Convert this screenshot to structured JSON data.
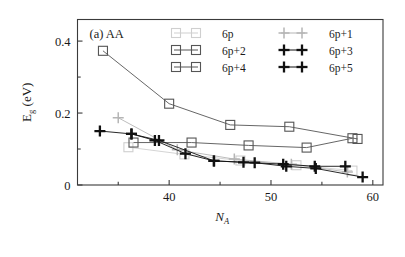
{
  "figure": {
    "panel_label": "(a) AA"
  },
  "axes": {
    "xlabel_main": "N",
    "xlabel_sub": "A",
    "ylabel_main": "E",
    "ylabel_sub": "g",
    "ylabel_unit": " (eV)",
    "x_ticklabels": [
      "40",
      "50",
      "60"
    ],
    "y_ticklabels": [
      "0",
      "0.2",
      "0.4"
    ]
  },
  "legend": {
    "entries": [
      {
        "label": "6p",
        "marker": "square",
        "color": "#cfcfcf"
      },
      {
        "label": "6p+1",
        "marker": "plus",
        "color": "#b5b5b5"
      },
      {
        "label": "6p+2",
        "marker": "square",
        "color": "#555555"
      },
      {
        "label": "6p+3",
        "marker": "plus",
        "color": "#111111"
      },
      {
        "label": "6p+4",
        "marker": "square",
        "color": "#555555"
      },
      {
        "label": "6p+5",
        "marker": "plus",
        "color": "#111111"
      }
    ]
  },
  "chart_data": {
    "type": "line",
    "title": "(a) AA",
    "xlabel": "N_A",
    "ylabel": "E_g (eV)",
    "xlim": [
      31,
      61
    ],
    "ylim": [
      0.0,
      0.46
    ],
    "xticks": [
      40,
      50,
      60
    ],
    "xminorticks": [
      35,
      45,
      55
    ],
    "yticks": [
      0,
      0.2,
      0.4
    ],
    "yminorticks": [
      0.1,
      0.3
    ],
    "grid": false,
    "legend_position": "top-right-inside",
    "series": [
      {
        "name": "6p",
        "marker": "square",
        "color": "#cfcfcf",
        "x": [
          36.0,
          41.5,
          47.0,
          52.5,
          58.0
        ],
        "y": [
          0.105,
          0.085,
          0.068,
          0.055,
          0.04
        ]
      },
      {
        "name": "6p+1",
        "marker": "plus",
        "color": "#b5b5b5",
        "x": [
          35.0,
          40.8,
          46.4,
          52.0,
          57.5
        ],
        "y": [
          0.187,
          0.098,
          0.072,
          0.058,
          0.036
        ]
      },
      {
        "name": "6p+2",
        "marker": "square",
        "color": "#555555",
        "x": [
          36.5,
          42.2,
          47.8,
          53.5,
          58.0
        ],
        "y": [
          0.118,
          0.118,
          0.11,
          0.104,
          0.13
        ]
      },
      {
        "name": "6p+3",
        "marker": "plus",
        "color": "#111111",
        "x": [
          33.2,
          36.3,
          39.0,
          44.4,
          47.3,
          51.2,
          54.3,
          57.3
        ],
        "y": [
          0.15,
          0.142,
          0.124,
          0.067,
          0.063,
          0.058,
          0.052,
          0.052
        ]
      },
      {
        "name": "6p+4",
        "marker": "square",
        "color": "#555555",
        "x": [
          33.5,
          40.0,
          46.0,
          51.8,
          58.5
        ],
        "y": [
          0.373,
          0.226,
          0.167,
          0.162,
          0.128
        ]
      },
      {
        "name": "6p+5",
        "marker": "plus",
        "color": "#111111",
        "x": [
          36.3,
          38.6,
          41.6,
          44.4,
          48.4,
          51.5,
          54.4,
          59.0
        ],
        "y": [
          0.142,
          0.124,
          0.087,
          0.067,
          0.062,
          0.052,
          0.046,
          0.022
        ]
      }
    ]
  }
}
